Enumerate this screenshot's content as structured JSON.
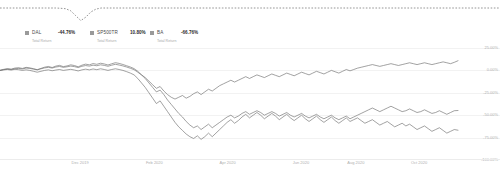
{
  "legend": {
    "items": [
      {
        "ticker": "DAL",
        "value": "-44.76%",
        "sublabel": "Total Return",
        "marker_color": "#9a9a9a"
      },
      {
        "ticker": "SP500TR",
        "value": "10.80%",
        "sublabel": "Total Return",
        "marker_color": "#9a9a9a"
      },
      {
        "ticker": "BA",
        "value": "-66.76%",
        "sublabel": "Total Return",
        "marker_color": "#9a9a9a"
      }
    ]
  },
  "chart_data": {
    "type": "line",
    "title": "",
    "xlabel": "",
    "ylabel": "",
    "grid": true,
    "legend_position": "top-left",
    "ylim": [
      -100,
      25
    ],
    "yticks": [
      25,
      0,
      -25,
      -50,
      -75,
      -100
    ],
    "ytick_labels": [
      "25.00%",
      "0.00%",
      "-25.00%",
      "-50.00%",
      "-75.00%",
      "-100.00%"
    ],
    "xtick_labels": [
      "Dec 2019",
      "Feb 2020",
      "Apr 2020",
      "Jun 2020",
      "Aug 2020",
      "Oct 2020"
    ],
    "xtick_positions": [
      0.175,
      0.337,
      0.497,
      0.657,
      0.777,
      0.915
    ],
    "series": [
      {
        "name": "DAL",
        "color": "#6f6f6f",
        "final_value": -44.76,
        "values": [
          0,
          1.2,
          2.0,
          1.4,
          2.6,
          3.0,
          2.2,
          3.4,
          2.8,
          1.9,
          0.8,
          2.2,
          3.6,
          4.4,
          3.2,
          4.8,
          5.6,
          4.2,
          5.0,
          6.2,
          5.4,
          4.0,
          5.8,
          7.0,
          6.2,
          7.6,
          6.8,
          8.0,
          7.2,
          6.0,
          7.4,
          8.6,
          7.8,
          6.6,
          5.2,
          3.8,
          2.0,
          -1.0,
          -5.0,
          -9.0,
          -14.0,
          -19.0,
          -24.0,
          -22.0,
          -27.0,
          -33.0,
          -38.0,
          -43.0,
          -48.0,
          -52.0,
          -57.0,
          -61.0,
          -64.0,
          -62.0,
          -66.0,
          -63.0,
          -60.0,
          -64.0,
          -61.0,
          -58.0,
          -55.0,
          -52.0,
          -50.0,
          -53.0,
          -51.0,
          -48.0,
          -46.0,
          -49.0,
          -47.0,
          -45.0,
          -47.0,
          -50.0,
          -48.0,
          -46.0,
          -48.0,
          -51.0,
          -49.0,
          -47.0,
          -50.0,
          -52.0,
          -50.0,
          -48.0,
          -51.0,
          -53.0,
          -51.0,
          -49.0,
          -52.0,
          -54.0,
          -52.0,
          -50.0,
          -53.0,
          -55.0,
          -53.0,
          -51.0,
          -54.0,
          -52.0,
          -50.0,
          -48.0,
          -46.0,
          -44.0,
          -42.0,
          -44.0,
          -46.0,
          -44.0,
          -42.0,
          -40.0,
          -42.0,
          -44.0,
          -46.0,
          -45.0,
          -43.0,
          -45.0,
          -47.0,
          -46.0,
          -44.0,
          -46.0,
          -48.0,
          -47.0,
          -45.0,
          -47.0,
          -49.0,
          -47.0,
          -45.0,
          -44.76
        ]
      },
      {
        "name": "SP500TR",
        "color": "#6f6f6f",
        "final_value": 10.8,
        "values": [
          0,
          0.8,
          1.4,
          1.0,
          1.8,
          2.2,
          1.6,
          2.6,
          2.2,
          1.4,
          0.6,
          1.8,
          2.8,
          3.4,
          2.6,
          3.8,
          4.4,
          3.4,
          4.0,
          4.8,
          4.2,
          3.2,
          4.6,
          5.4,
          4.8,
          5.8,
          5.2,
          6.2,
          5.6,
          4.6,
          5.8,
          6.8,
          6.0,
          5.0,
          3.8,
          2.4,
          0.8,
          -2.0,
          -5.0,
          -8.0,
          -12.0,
          -16.0,
          -20.0,
          -18.0,
          -23.0,
          -27.0,
          -30.0,
          -32.0,
          -30.0,
          -28.0,
          -31.0,
          -29.0,
          -26.0,
          -24.0,
          -27.0,
          -24.0,
          -21.0,
          -23.0,
          -20.0,
          -17.0,
          -15.0,
          -13.0,
          -11.0,
          -13.0,
          -11.0,
          -9.0,
          -7.0,
          -9.0,
          -7.0,
          -5.0,
          -6.5,
          -8.0,
          -6.0,
          -4.0,
          -5.5,
          -7.0,
          -5.0,
          -3.0,
          -4.5,
          -6.0,
          -4.0,
          -2.0,
          -3.5,
          -5.0,
          -3.0,
          -1.0,
          -2.5,
          -4.0,
          -2.0,
          0.0,
          -1.5,
          -3.0,
          -1.0,
          1.0,
          -0.5,
          1.0,
          2.5,
          3.5,
          4.5,
          5.5,
          6.5,
          5.5,
          4.5,
          5.5,
          6.5,
          7.5,
          6.5,
          5.5,
          6.5,
          7.5,
          8.5,
          7.5,
          6.5,
          7.5,
          8.5,
          7.5,
          6.5,
          7.5,
          8.5,
          9.5,
          8.5,
          7.5,
          9.0,
          10.8
        ]
      },
      {
        "name": "BA",
        "color": "#6f6f6f",
        "final_value": -66.76,
        "values": [
          0,
          0.6,
          1.0,
          0.4,
          1.2,
          0.8,
          0.0,
          0.6,
          0.0,
          -1.0,
          -2.0,
          -1.0,
          0.0,
          0.6,
          -0.4,
          0.4,
          1.0,
          0.0,
          0.6,
          1.2,
          0.4,
          -0.6,
          0.6,
          1.4,
          0.6,
          1.6,
          0.8,
          1.8,
          1.0,
          0.0,
          1.0,
          1.8,
          1.0,
          0.0,
          -1.4,
          -3.0,
          -5.0,
          -9.0,
          -14.0,
          -19.0,
          -25.0,
          -31.0,
          -37.0,
          -34.0,
          -40.0,
          -46.0,
          -52.0,
          -58.0,
          -63.0,
          -67.0,
          -71.0,
          -74.0,
          -76.0,
          -73.0,
          -77.0,
          -74.0,
          -70.0,
          -74.0,
          -70.0,
          -66.0,
          -62.0,
          -58.0,
          -55.0,
          -59.0,
          -56.0,
          -52.0,
          -49.0,
          -53.0,
          -50.0,
          -47.0,
          -50.0,
          -54.0,
          -51.0,
          -48.0,
          -51.0,
          -55.0,
          -52.0,
          -49.0,
          -53.0,
          -56.0,
          -53.0,
          -50.0,
          -54.0,
          -57.0,
          -54.0,
          -51.0,
          -55.0,
          -58.0,
          -55.0,
          -52.0,
          -56.0,
          -59.0,
          -56.0,
          -53.0,
          -57.0,
          -55.0,
          -53.0,
          -56.0,
          -59.0,
          -57.0,
          -55.0,
          -58.0,
          -61.0,
          -59.0,
          -57.0,
          -60.0,
          -63.0,
          -61.0,
          -59.0,
          -62.0,
          -60.0,
          -63.0,
          -66.0,
          -64.0,
          -62.0,
          -65.0,
          -68.0,
          -66.0,
          -64.0,
          -67.0,
          -70.0,
          -68.0,
          -66.0,
          -66.76
        ]
      }
    ],
    "sparkline": {
      "style": "dashed",
      "color": "#7a7a7a",
      "values": [
        1,
        1,
        1,
        1,
        1,
        1,
        1,
        1,
        1,
        1,
        1,
        1,
        0.98,
        0.95,
        0.8,
        0.45,
        0.1,
        0.35,
        0.72,
        0.92,
        1,
        1,
        1,
        1,
        1,
        1,
        1,
        1,
        1,
        1,
        1,
        1,
        1,
        1,
        1,
        1,
        1,
        1,
        1,
        1,
        1,
        1,
        1,
        1,
        1,
        1,
        1,
        1,
        1,
        1,
        1,
        1,
        1,
        1,
        1,
        1,
        1,
        1,
        1,
        1,
        1,
        1,
        1,
        1,
        1,
        1,
        1,
        1,
        1,
        1,
        1,
        1,
        1,
        1,
        1,
        1,
        1,
        1,
        1,
        1,
        1,
        1,
        1,
        1,
        1,
        1,
        1,
        1,
        1,
        1,
        1,
        1,
        1,
        1,
        1,
        1,
        1,
        1,
        1,
        1
      ]
    }
  }
}
